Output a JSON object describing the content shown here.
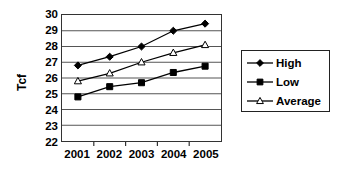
{
  "chart_data": {
    "type": "line",
    "title": "",
    "xlabel": "",
    "ylabel": "Tcf",
    "categories": [
      "2001",
      "2002",
      "2003",
      "2004",
      "2005"
    ],
    "ylim": [
      22,
      30
    ],
    "yticks": [
      22,
      23,
      24,
      25,
      26,
      27,
      28,
      29,
      30
    ],
    "grid": true,
    "legend_position": "right",
    "series": [
      {
        "name": "High",
        "marker": "diamond",
        "color": "#000000",
        "values": [
          26.8,
          27.35,
          28.0,
          29.0,
          29.45
        ]
      },
      {
        "name": "Low",
        "marker": "square",
        "color": "#000000",
        "values": [
          24.8,
          25.45,
          25.7,
          26.35,
          26.75
        ]
      },
      {
        "name": "Average",
        "marker": "triangle",
        "color": "#000000",
        "values": [
          25.8,
          26.3,
          27.0,
          27.6,
          28.1
        ]
      }
    ]
  },
  "axes": {
    "y_title": "Tcf",
    "y_tick_labels": [
      "30",
      "29",
      "28",
      "27",
      "26",
      "25",
      "24",
      "23",
      "22"
    ],
    "x_tick_labels": [
      "2001",
      "2002",
      "2003",
      "2004",
      "2005"
    ]
  },
  "legend": {
    "entries": [
      {
        "label": "High",
        "marker": "diamond-marker-icon"
      },
      {
        "label": "Low",
        "marker": "square-marker-icon"
      },
      {
        "label": "Average",
        "marker": "triangle-marker-icon"
      }
    ]
  }
}
